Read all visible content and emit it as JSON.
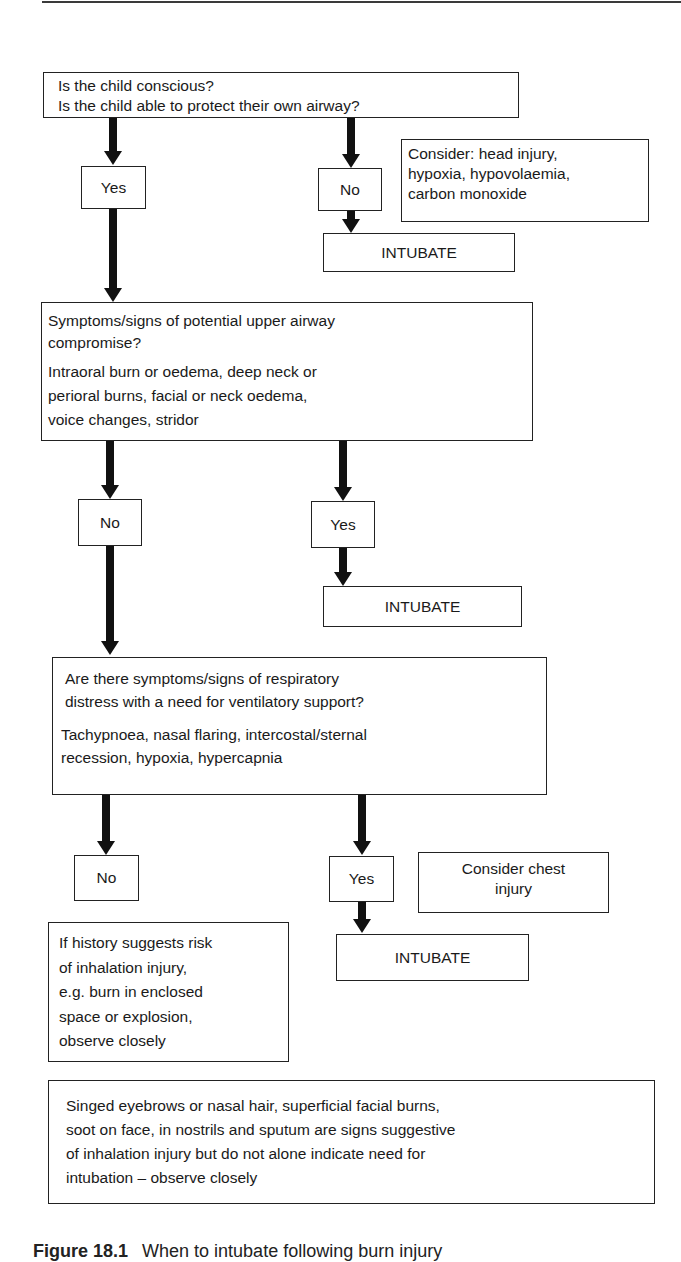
{
  "flowchart": {
    "q1": {
      "lines": [
        "Is the child conscious?",
        "Is the child able to protect their own airway?"
      ],
      "yes_label": "Yes",
      "no_label": "No",
      "no_note": [
        "Consider: head injury,",
        "hypoxia, hypovolaemia,",
        "carbon monoxide"
      ],
      "no_action": "INTUBATE"
    },
    "q2": {
      "question": [
        "Symptoms/signs of potential upper airway",
        "compromise?"
      ],
      "details": [
        "Intraoral burn or oedema, deep neck or",
        "perioral burns, facial or neck oedema,",
        "voice changes, stridor"
      ],
      "no_label": "No",
      "yes_label": "Yes",
      "yes_action": "INTUBATE"
    },
    "q3": {
      "question": [
        "Are there symptoms/signs of respiratory",
        "distress with a need for ventilatory support?"
      ],
      "details": [
        "Tachypnoea, nasal flaring, intercostal/sternal",
        "recession, hypoxia, hypercapnia"
      ],
      "no_label": "No",
      "yes_label": "Yes",
      "yes_note": [
        "Consider chest",
        "injury"
      ],
      "yes_action": "INTUBATE",
      "no_note": [
        "If history suggests risk",
        "of inhalation injury,",
        "e.g. burn in enclosed",
        "space or explosion,",
        "observe closely"
      ]
    },
    "footnote": [
      "Singed eyebrows or nasal hair, superficial facial burns,",
      "soot on face, in nostrils and sputum are signs suggestive",
      "of inhalation injury but do not alone indicate need for",
      "intubation – observe closely"
    ]
  },
  "caption": {
    "label": "Figure 18.1",
    "text": "When to intubate following burn injury"
  }
}
